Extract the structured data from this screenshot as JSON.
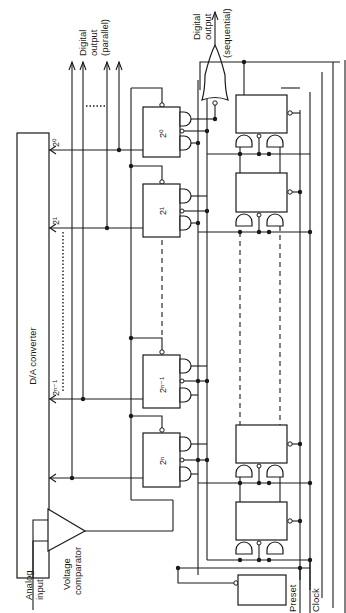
{
  "diagram": {
    "type": "circuit-schematic",
    "orientation": "rotated-90",
    "colors": {
      "ink": "#1a1a1a",
      "background": "#ffffff"
    },
    "labels": {
      "analog_input_1": "Analog",
      "analog_input_2": "input",
      "comparator_1": "Voltage",
      "comparator_2": "comparator",
      "dac": "D/A converter",
      "digital_parallel_1": "Digital",
      "digital_parallel_2": "output",
      "digital_parallel_3": "(parallel)",
      "digital_sequential_1": "Digital",
      "digital_sequential_2": "output",
      "digital_sequential_3": "(sequential)",
      "preset": "Preset",
      "clock": "Clock"
    },
    "dac_inputs": [
      {
        "label": "2⁰"
      },
      {
        "label": "2¹"
      },
      {
        "label": "2ⁿ⁻¹"
      },
      {
        "label": "2ⁿ"
      }
    ],
    "register_bits": [
      {
        "label": "2⁰"
      },
      {
        "label": "2¹"
      },
      {
        "label": "2ⁿ⁻¹"
      },
      {
        "label": "2ⁿ"
      }
    ],
    "components": {
      "comparator": "Voltage comparator",
      "converter": "D/A converter",
      "output_gate": "OR gate",
      "shift_register_stages": 5
    }
  }
}
